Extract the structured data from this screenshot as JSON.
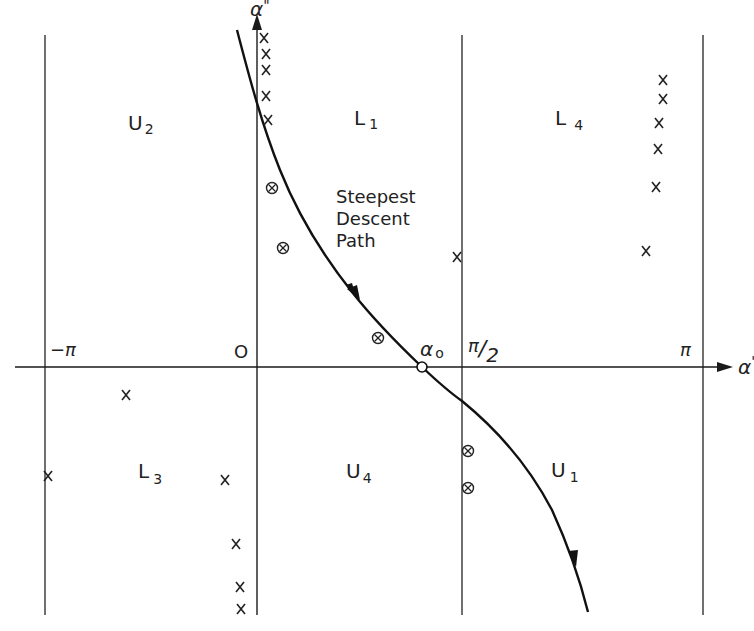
{
  "diagram": {
    "type": "complex-plane steepest descent contour diagram",
    "axes": {
      "horizontal": {
        "name": "α",
        "prime": "'"
      },
      "vertical": {
        "name": "α",
        "prime": "\""
      }
    },
    "ticks": {
      "neg_pi": "−π",
      "zero": "O",
      "half_pi_num": "π",
      "half_pi_slash": "/",
      "half_pi_den": "2",
      "pi": "π"
    },
    "saddle_point": {
      "label": "α",
      "sub": "o"
    },
    "path_label": {
      "line1": "Steepest",
      "line2": "Descent",
      "line3": "Path"
    },
    "regions": [
      {
        "id": "U2",
        "main": "U",
        "sub": "2"
      },
      {
        "id": "L1",
        "main": "L",
        "sub": "1"
      },
      {
        "id": "L4",
        "main": "L",
        "sub": "4"
      },
      {
        "id": "L3",
        "main": "L",
        "sub": "3"
      },
      {
        "id": "U4",
        "main": "U",
        "sub": "4"
      },
      {
        "id": "U1",
        "main": "U",
        "sub": "1"
      }
    ],
    "markers": {
      "pole_glyph": "x",
      "saddle_glyph": "⊗",
      "poles": [
        [
          264,
          38
        ],
        [
          266,
          54
        ],
        [
          266,
          70
        ],
        [
          266,
          96
        ],
        [
          268,
          120
        ],
        [
          663,
          80
        ],
        [
          663,
          99
        ],
        [
          659,
          123
        ],
        [
          658,
          149
        ],
        [
          656,
          187
        ],
        [
          646,
          251
        ],
        [
          457,
          257
        ],
        [
          126,
          395
        ],
        [
          48,
          476
        ],
        [
          225,
          480
        ],
        [
          236,
          544
        ],
        [
          240,
          587
        ],
        [
          241,
          609
        ]
      ],
      "crossed_circles": [
        [
          272,
          188
        ],
        [
          283,
          248
        ],
        [
          378,
          338
        ],
        [
          468,
          451
        ],
        [
          468,
          488
        ]
      ]
    },
    "colors": {
      "line": "#1a1a1a",
      "background": "#ffffff"
    }
  }
}
